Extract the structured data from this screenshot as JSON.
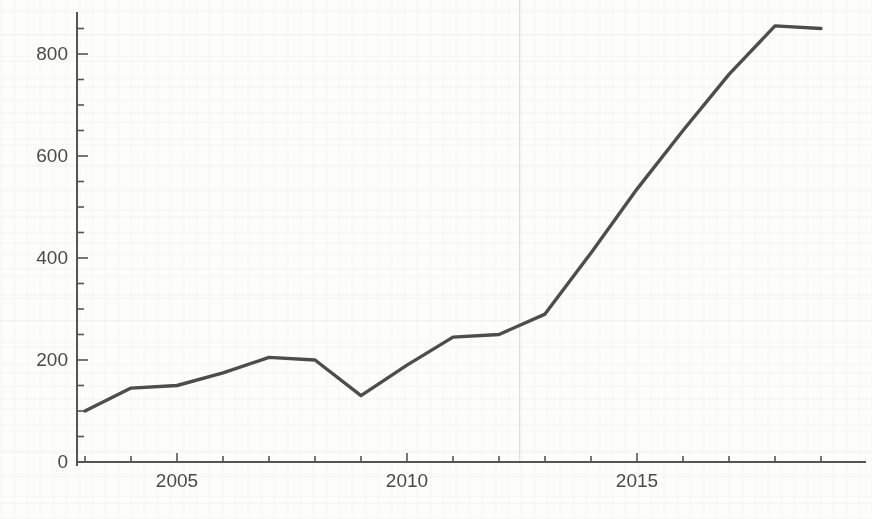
{
  "chart_data": {
    "type": "line",
    "title": "",
    "subtitle": "",
    "xlabel": "",
    "ylabel": "",
    "x": [
      2003,
      2004,
      2005,
      2006,
      2007,
      2008,
      2009,
      2010,
      2011,
      2012,
      2013,
      2014,
      2015,
      2016,
      2017,
      2018,
      2019
    ],
    "values": [
      100,
      145,
      150,
      175,
      205,
      200,
      130,
      190,
      245,
      250,
      290,
      410,
      535,
      650,
      760,
      855,
      850
    ],
    "series": [
      {
        "name": "series-1",
        "values": [
          100,
          145,
          150,
          175,
          205,
          200,
          130,
          190,
          245,
          250,
          290,
          410,
          535,
          650,
          760,
          855,
          850
        ]
      }
    ],
    "xlim": [
      2002.8,
      2019.6
    ],
    "ylim": [
      0,
      880
    ],
    "x_tick_labels": [
      "2005",
      "2010",
      "2015"
    ],
    "x_tick_values": [
      2005,
      2010,
      2015
    ],
    "x_minor_tick_values": [
      2003,
      2004,
      2006,
      2007,
      2008,
      2009,
      2011,
      2012,
      2013,
      2014,
      2016,
      2017,
      2018,
      2019
    ],
    "y_tick_labels": [
      "0",
      "200",
      "400",
      "600",
      "800"
    ],
    "y_tick_values": [
      0,
      200,
      400,
      600,
      800
    ],
    "y_minor_tick_values": [
      50,
      100,
      150,
      250,
      300,
      350,
      450,
      500,
      550,
      650,
      700,
      750,
      850
    ],
    "grid": false,
    "legend": false,
    "legend_position": "none",
    "line_color": "#4d4d4d",
    "axis_color": "#555555",
    "background_color": "#fdfdfc",
    "annotations": [
      {
        "name": "faint-vertical-rule",
        "x": 2012.45,
        "label": ""
      }
    ]
  },
  "axes": {
    "y_labels": [
      "800",
      "600",
      "400",
      "200",
      "0"
    ],
    "x_labels": [
      "2005",
      "2010",
      "2015"
    ]
  }
}
